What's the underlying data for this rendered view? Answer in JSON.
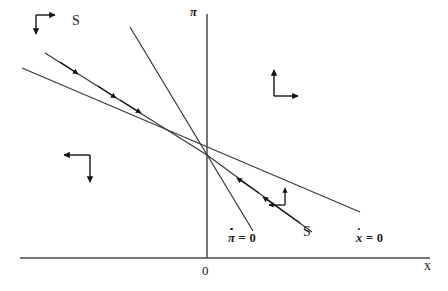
{
  "figure": {
    "kind": "phase-diagram",
    "background_color": "#ffffff",
    "stroke_color": "#3a3a3a",
    "text_color": "#1c1c1c",
    "width": 448,
    "height": 291
  },
  "axes": {
    "vertical_label": "π",
    "horizontal_label": "x",
    "origin_label": "0",
    "origin_point": {
      "x": 207,
      "y": 258
    },
    "vertical_axis": {
      "x": 207,
      "y_top": 14,
      "y_bottom": 258
    },
    "horizontal_axis": {
      "y": 258,
      "x_left": 20,
      "x_right": 430
    }
  },
  "equilibrium": {
    "x": 207,
    "y": 155
  },
  "loci": [
    {
      "id": "pi-dot-zero",
      "label_base": "π",
      "label_rest": " = 0",
      "label_full": "π̇ = 0",
      "description": "steep downward sloping locus",
      "x1": 130,
      "y1": 27,
      "x2": 253,
      "y2": 231,
      "label_x": 231,
      "label_y": 238
    },
    {
      "id": "x-dot-zero",
      "label_base": "x",
      "label_rest": " = 0",
      "label_full": "ẋ = 0",
      "description": "shallow downward sloping locus",
      "x1": 22,
      "y1": 68,
      "x2": 360,
      "y2": 212,
      "label_x": 358,
      "label_y": 238
    }
  ],
  "saddle_path": {
    "label": "S",
    "upper_branch": {
      "x1": 45,
      "y1": 53,
      "x2": 207,
      "y2": 155
    },
    "lower_branch": {
      "x1": 207,
      "y1": 155,
      "x2": 312,
      "y2": 232
    },
    "upper_label": {
      "text": "S",
      "x": 72,
      "y": 15
    },
    "lower_label": {
      "text": "S",
      "x": 303,
      "y": 227
    },
    "upper_arrow_count": 3,
    "lower_arrow_count": 2,
    "direction": "toward the equilibrium"
  },
  "motion_arrows": [
    {
      "id": "northwest-region",
      "horizontal": "right",
      "vertical": "down",
      "corner_x": 36,
      "corner_y": 15
    },
    {
      "id": "northeast-region",
      "horizontal": "right",
      "vertical": "up",
      "corner_x": 274,
      "corner_y": 96
    },
    {
      "id": "southwest-region",
      "horizontal": "left",
      "vertical": "down",
      "corner_x": 90,
      "corner_y": 155
    },
    {
      "id": "southeast-region",
      "horizontal": "left",
      "vertical": "up",
      "corner_x": 285,
      "corner_y": 205
    }
  ]
}
